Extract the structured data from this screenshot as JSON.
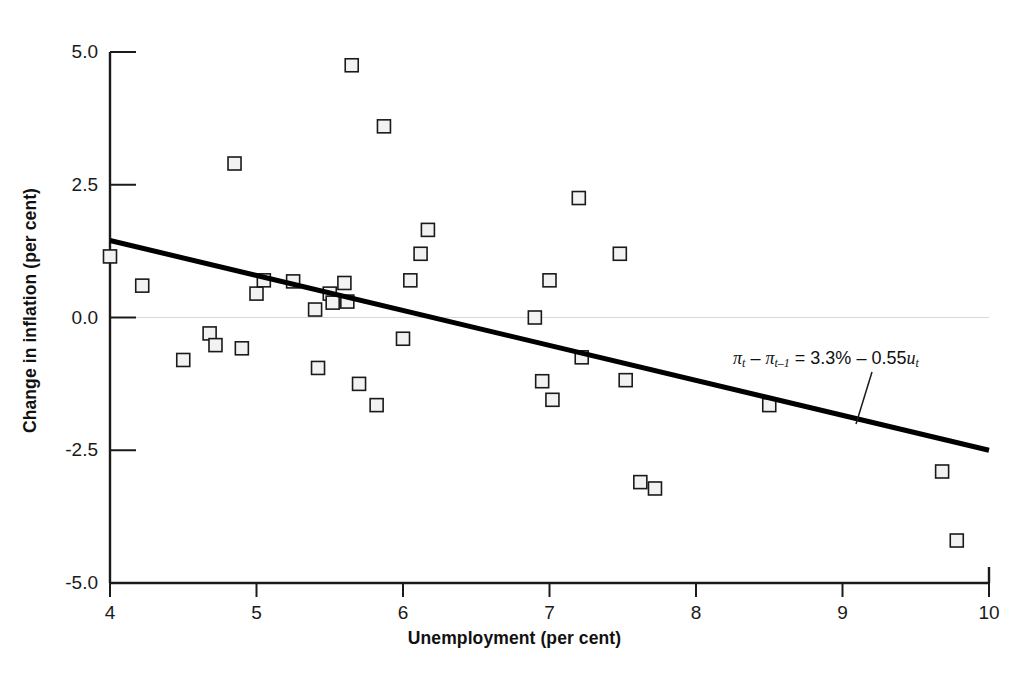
{
  "chart_data": {
    "type": "scatter",
    "title": "",
    "xlabel": "Unemployment (per cent)",
    "ylabel": "Change in inflation (per cent)",
    "xlim": [
      4,
      10
    ],
    "ylim": [
      -5.0,
      5.0
    ],
    "xticks": [
      "4",
      "5",
      "6",
      "7",
      "8",
      "9",
      "10"
    ],
    "yticks": [
      "5.0",
      "2.5",
      "0.0",
      "-2.5",
      "-5.0"
    ],
    "grid": false,
    "zero_line": true,
    "legend": "none",
    "marker": "open-square",
    "marker_color": "#f2f2f2",
    "marker_edge_color": "#1a1a1a",
    "line_color": "#000000",
    "points": [
      {
        "x": 4.0,
        "y": 1.15
      },
      {
        "x": 4.22,
        "y": 0.6
      },
      {
        "x": 4.5,
        "y": -0.8
      },
      {
        "x": 4.68,
        "y": -0.3
      },
      {
        "x": 4.72,
        "y": -0.52
      },
      {
        "x": 4.85,
        "y": 2.9
      },
      {
        "x": 4.9,
        "y": -0.58
      },
      {
        "x": 5.0,
        "y": 0.45
      },
      {
        "x": 5.05,
        "y": 0.7
      },
      {
        "x": 5.25,
        "y": 0.68
      },
      {
        "x": 5.4,
        "y": 0.15
      },
      {
        "x": 5.42,
        "y": -0.95
      },
      {
        "x": 5.5,
        "y": 0.45
      },
      {
        "x": 5.52,
        "y": 0.28
      },
      {
        "x": 5.6,
        "y": 0.65
      },
      {
        "x": 5.62,
        "y": 0.3
      },
      {
        "x": 5.65,
        "y": 4.75
      },
      {
        "x": 5.7,
        "y": -1.25
      },
      {
        "x": 5.82,
        "y": -1.65
      },
      {
        "x": 5.87,
        "y": 3.6
      },
      {
        "x": 6.0,
        "y": -0.4
      },
      {
        "x": 6.05,
        "y": 0.7
      },
      {
        "x": 6.12,
        "y": 1.2
      },
      {
        "x": 6.17,
        "y": 1.65
      },
      {
        "x": 6.9,
        "y": 0.0
      },
      {
        "x": 6.95,
        "y": -1.2
      },
      {
        "x": 7.0,
        "y": 0.7
      },
      {
        "x": 7.02,
        "y": -1.55
      },
      {
        "x": 7.2,
        "y": 2.25
      },
      {
        "x": 7.22,
        "y": -0.75
      },
      {
        "x": 7.48,
        "y": 1.2
      },
      {
        "x": 7.52,
        "y": -1.18
      },
      {
        "x": 7.62,
        "y": -3.1
      },
      {
        "x": 7.72,
        "y": -3.22
      },
      {
        "x": 8.5,
        "y": -1.65
      },
      {
        "x": 9.68,
        "y": -2.9
      },
      {
        "x": 9.78,
        "y": -4.2
      }
    ],
    "fit_line": {
      "equation_label": "3.3% - 0.55u",
      "intercept": 3.3,
      "slope": -0.55,
      "x_start": 4.0,
      "y_start": 1.45,
      "x_end": 10.0,
      "y_end": -2.5
    },
    "annotation": {
      "pi": "π",
      "lhs_var": "t",
      "lhs_var2": "t–1",
      "minus": "–",
      "equals": "=",
      "rhs": "3.3%",
      "slope_term": "0.55",
      "u_var": "u",
      "u_sub": "t"
    }
  }
}
